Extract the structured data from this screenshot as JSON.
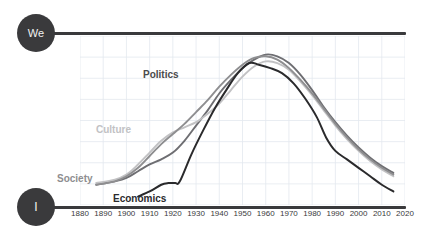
{
  "axis_poles": {
    "top": {
      "label": "We",
      "icon": "we-circle"
    },
    "bottom": {
      "label": "I",
      "icon": "i-circle"
    }
  },
  "colors": {
    "ink": "#3a3a3c",
    "economics": "#2a2a2c",
    "politics": "#6e6e72",
    "society": "#8e8e90",
    "culture": "#c2c2c4",
    "grid": "#e3e8ef",
    "background": "#ffffff"
  },
  "series_labels": {
    "politics": "Politics",
    "culture": "Culture",
    "society": "Society",
    "economics": "Economics"
  },
  "chart_data": {
    "type": "line",
    "title": "",
    "subtitle": "",
    "xlabel": "",
    "ylabel": "",
    "ylim": [
      0,
      100
    ],
    "ylim_labels": [
      "I",
      "We"
    ],
    "xlim": [
      1880,
      2020
    ],
    "grid": true,
    "legend": "inline-labels",
    "x_ticks": [
      1880,
      1890,
      1900,
      1910,
      1920,
      1930,
      1940,
      1950,
      1960,
      1970,
      1980,
      1990,
      2000,
      2010,
      2020
    ],
    "annotations": [
      "Top axis pole labelled We",
      "Bottom axis pole labelled I",
      "Four curves all peak between 1950 and 1965 then decline"
    ],
    "series": [
      {
        "name": "Politics",
        "color": "#6e6e72",
        "x": [
          1887,
          1895,
          1900,
          1905,
          1910,
          1915,
          1920,
          1925,
          1930,
          1935,
          1940,
          1945,
          1950,
          1955,
          1960,
          1965,
          1970,
          1975,
          1980,
          1985,
          1990,
          1995,
          2000,
          2005,
          2010,
          2015
        ],
        "values": [
          12,
          14,
          16,
          20,
          24,
          27,
          31,
          38,
          47,
          56,
          66,
          74,
          81,
          86,
          89,
          88,
          84,
          77,
          68,
          58,
          49,
          41,
          34,
          28,
          23,
          19
        ]
      },
      {
        "name": "Culture",
        "color": "#c2c2c4",
        "x": [
          1887,
          1895,
          1900,
          1905,
          1910,
          1915,
          1920,
          1925,
          1930,
          1935,
          1940,
          1945,
          1950,
          1955,
          1960,
          1965,
          1970,
          1975,
          1980,
          1985,
          1990,
          1995,
          2000,
          2005,
          2010,
          2015
        ],
        "values": [
          13,
          15,
          18,
          24,
          31,
          38,
          43,
          46,
          49,
          54,
          60,
          68,
          76,
          82,
          85,
          84,
          80,
          73,
          65,
          56,
          47,
          39,
          32,
          26,
          21,
          17
        ]
      },
      {
        "name": "Society",
        "color": "#8e8e90",
        "x": [
          1887,
          1895,
          1900,
          1905,
          1910,
          1915,
          1920,
          1925,
          1930,
          1935,
          1940,
          1945,
          1950,
          1955,
          1960,
          1965,
          1970,
          1975,
          1980,
          1985,
          1990,
          1995,
          2000,
          2005,
          2010,
          2015
        ],
        "values": [
          12,
          14,
          17,
          22,
          29,
          36,
          42,
          48,
          55,
          62,
          70,
          77,
          83,
          87,
          88,
          86,
          81,
          74,
          66,
          57,
          48,
          40,
          33,
          27,
          22,
          18
        ]
      },
      {
        "name": "Economics",
        "color": "#2a2a2c",
        "x": [
          1905,
          1910,
          1915,
          1918,
          1921,
          1923,
          1928,
          1933,
          1938,
          1943,
          1948,
          1953,
          1957,
          1962,
          1967,
          1972,
          1977,
          1982,
          1986,
          1990,
          1995,
          2000,
          2005,
          2010,
          2015
        ],
        "values": [
          5,
          8,
          12,
          13,
          13,
          14,
          30,
          44,
          57,
          68,
          78,
          84,
          83,
          81,
          78,
          72,
          63,
          52,
          40,
          32,
          27,
          22,
          17,
          12,
          8
        ]
      }
    ]
  }
}
